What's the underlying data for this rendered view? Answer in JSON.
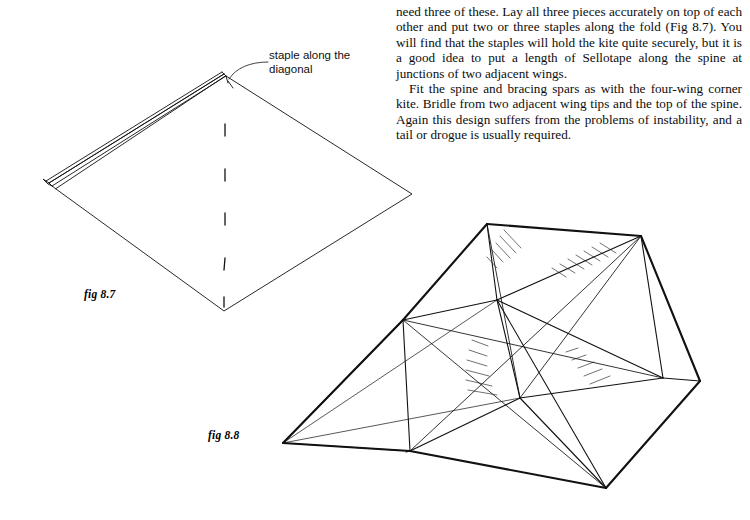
{
  "page": {
    "width": 750,
    "height": 520,
    "background": "#ffffff",
    "ink": "#111111"
  },
  "text_column": {
    "paragraphs": [
      "need three of these. Lay all three pieces accurately on top of each other and put two or three staples along the fold (Fig 8.7). You will find that the staples will hold the kite quite securely, but it is a good idea to put a length of Sellotape along the spine at junctions of two adjacent wings.",
      "Fit the spine and bracing spars as with the four-wing corner kite. Bridle from two adjacent wing tips and the top of the spine. Again this design suffers from the problems of instability, and a tail or drogue is usually required."
    ]
  },
  "annotation": {
    "staple_label": "staple along the diagonal"
  },
  "figures": [
    {
      "id": "fig-8-7",
      "caption": "fig 8.7"
    },
    {
      "id": "fig-8-8",
      "caption": "fig 8.8"
    }
  ]
}
